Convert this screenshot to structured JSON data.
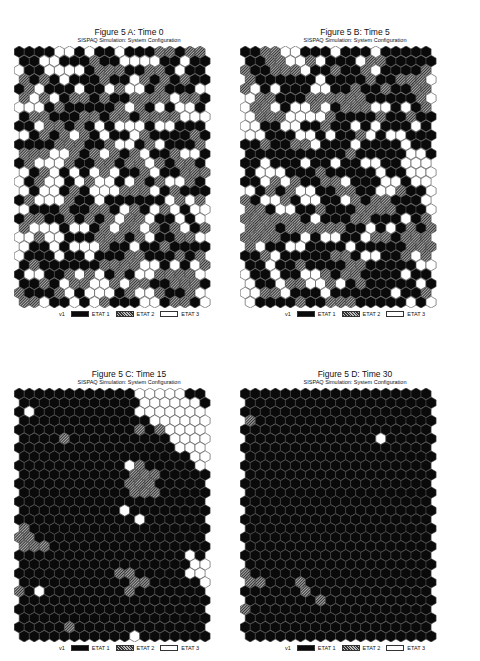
{
  "figure": {
    "subtitle": "SISPAQ Simulation: System Configuration",
    "legend": {
      "prefix": "v1",
      "items": [
        {
          "label": "ETAT 1",
          "fill": "#0a0a0a",
          "state": 1
        },
        {
          "label": "ETAT 2",
          "fill": "#777777",
          "state": 2
        },
        {
          "label": "ETAT 3",
          "fill": "#ffffff",
          "state": 3
        }
      ]
    },
    "grid": {
      "cols": 19,
      "rows": 28,
      "shape": "hexagon"
    }
  },
  "panels": [
    {
      "id": "A",
      "title": "Figure 5 A: Time 0",
      "time": 0,
      "seed": 11,
      "mix": [
        0.42,
        0.28,
        0.3
      ],
      "cluster": 0.05
    },
    {
      "id": "B",
      "title": "Figure 5 B: Time 5",
      "time": 5,
      "seed": 23,
      "mix": [
        0.42,
        0.26,
        0.32
      ],
      "cluster": 0.35
    },
    {
      "id": "C",
      "title": "Figure 5 C: Time 15",
      "time": 15,
      "seed": 37,
      "mix": [
        0.48,
        0.24,
        0.28
      ],
      "cluster": 0.65
    },
    {
      "id": "D",
      "title": "Figure 5 D: Time 30",
      "time": 30,
      "seed": 53,
      "mix": [
        0.48,
        0.24,
        0.28
      ],
      "cluster": 0.8
    }
  ]
}
